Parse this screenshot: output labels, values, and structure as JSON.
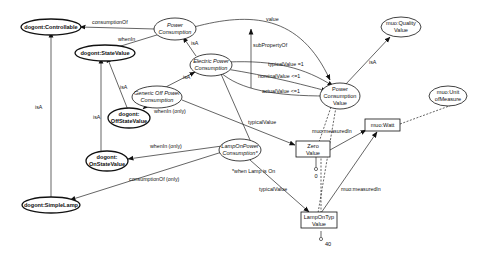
{
  "diagram": {
    "nodes": {
      "controllable": {
        "label": "dogont:Controllable"
      },
      "state_value": {
        "label": "dogont:StateValue"
      },
      "power_consumption": {
        "line1": "Power",
        "line2": "Consumption"
      },
      "electric_power": {
        "line1": "Electric Power",
        "line2": "Consumption"
      },
      "generic_off": {
        "line1": "Generic Off Power",
        "line2": "Consumption"
      },
      "off_state": {
        "line1": "dogont:",
        "line2": "OffStateValue"
      },
      "on_state": {
        "line1": "dogont:",
        "line2": "OnStateValue"
      },
      "lamp_on": {
        "line1": "LampOnPower",
        "line2": "Consumption*"
      },
      "simple_lamp": {
        "label": "dogont:SimpleLamp"
      },
      "pcv": {
        "line1": "Power",
        "line2": "Consumption",
        "line3": "Value"
      },
      "quality_value": {
        "line1": "muo:Quality",
        "line2": "Value"
      },
      "unit_measure": {
        "line1": "muo:Unit",
        "line2": "ofMeasure"
      },
      "zero_value": {
        "line1": "Zero",
        "line2": "Value"
      },
      "watt": {
        "label": "muo:Watt"
      },
      "lamp_on_typ": {
        "line1": "LampOnTyp",
        "line2": "Value"
      },
      "literal_zero": {
        "label": "0"
      },
      "literal_forty": {
        "label": "40"
      }
    },
    "edges": {
      "consumption_of": "consumptionOf",
      "when_in": "whenIn",
      "value": "value",
      "sub_property_of": "subPropertyOf",
      "isa_electric": "isA",
      "isa_generic": "isA",
      "isa_off": "isA",
      "isa_on": "isA",
      "isa_controllable": "isA",
      "isa_quality": "isA",
      "typical_value_eq": "typicalValue =1",
      "nominal_value": "nominalValue <=1",
      "actual_value": "actualValue <=1",
      "when_in_only_off": "whenIn (only)",
      "when_in_only_on": "whenIn (only)",
      "typical_value_off": "typicalValue",
      "typical_value_lamp": "typicalValue",
      "consumption_of_only": "consumptionOf (only)",
      "measured_in_zero": "muo:measuredIn",
      "measured_in_lamp": "muo:measuredIn",
      "annotation": "*when Lamp is On"
    }
  }
}
